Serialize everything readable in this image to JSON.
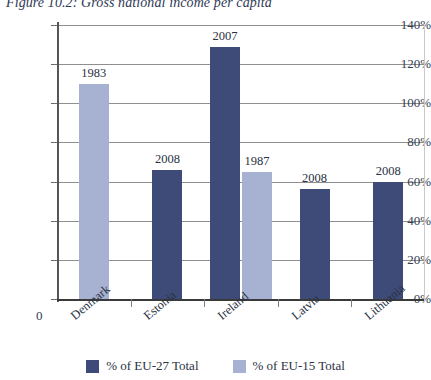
{
  "figure": {
    "title": "Figure 10.2: Gross national income per capita"
  },
  "legend": {
    "items": [
      {
        "label": "% of EU-27 Total",
        "color": "#3e4a78",
        "key": "eu27"
      },
      {
        "label": "% of EU-15 Total",
        "color": "#a7b1d1",
        "key": "eu15"
      }
    ]
  },
  "axis": {
    "y_ticks": [
      "0%",
      "20%",
      "40%",
      "60%",
      "80%",
      "100%",
      "120%",
      "140%"
    ],
    "origin_label": "0"
  },
  "chart_data": {
    "type": "bar",
    "title": "Figure 10.2: Gross national income per capita",
    "xlabel": "",
    "ylabel": "",
    "ylim": [
      0,
      140
    ],
    "ytick_values": [
      0,
      20,
      40,
      60,
      80,
      100,
      120,
      140
    ],
    "ytick_labels": [
      "0%",
      "20%",
      "40%",
      "60%",
      "80%",
      "100%",
      "120%",
      "140%"
    ],
    "grid": true,
    "legend_position": "bottom-center",
    "categories": [
      "Denmark",
      "Estonia",
      "Ireland",
      "Latvia",
      "Lithuania"
    ],
    "series": [
      {
        "name": "% of EU-27 Total",
        "color": "#3e4a78",
        "values": [
          null,
          66,
          129,
          56,
          60
        ],
        "point_labels": [
          null,
          "2008",
          "2007",
          "2008",
          "2008"
        ]
      },
      {
        "name": "% of EU-15 Total",
        "color": "#a7b1d1",
        "values": [
          110,
          null,
          65,
          null,
          null
        ],
        "point_labels": [
          "1983",
          null,
          "1987",
          null,
          null
        ]
      }
    ],
    "bars": [
      {
        "category": "Denmark",
        "series": "% of EU-15 Total",
        "value": 110,
        "label": "1983"
      },
      {
        "category": "Estonia",
        "series": "% of EU-27 Total",
        "value": 66,
        "label": "2008"
      },
      {
        "category": "Ireland",
        "series": "% of EU-27 Total",
        "value": 129,
        "label": "2007"
      },
      {
        "category": "Ireland",
        "series": "% of EU-15 Total",
        "value": 65,
        "label": "1987"
      },
      {
        "category": "Latvia",
        "series": "% of EU-27 Total",
        "value": 56,
        "label": "2008"
      },
      {
        "category": "Lithuania",
        "series": "% of EU-27 Total",
        "value": 60,
        "label": "2008"
      }
    ]
  }
}
